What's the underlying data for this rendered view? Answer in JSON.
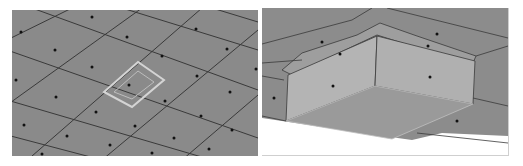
{
  "figure": {
    "panels": [
      {
        "id": "left",
        "description": "Quad surface mesh with face centroid dots and one highlighted inset quad",
        "mesh_color": "#8a8a8a",
        "edge_color": "#3a3a3a",
        "highlight_color": "#d0d0d0"
      },
      {
        "id": "right",
        "description": "Close-up 3D view of extruded quad face with beveled sides",
        "mesh_color": "#8c8c8c",
        "face_color": "#b4b4b4",
        "bottom_color": "#9a9a9a"
      }
    ]
  }
}
